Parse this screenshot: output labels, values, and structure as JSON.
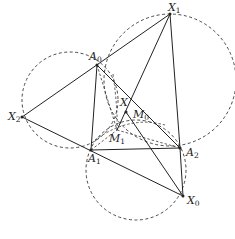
{
  "diagram": {
    "points": {
      "X1": {
        "label": "X",
        "sub": "1",
        "x": 170,
        "y": 14
      },
      "A0": {
        "label": "A",
        "sub": "0",
        "x": 97,
        "y": 65
      },
      "X2": {
        "label": "X",
        "sub": "2",
        "x": 22,
        "y": 117
      },
      "A1": {
        "label": "A",
        "sub": "1",
        "x": 91,
        "y": 150
      },
      "A2": {
        "label": "A",
        "sub": "2",
        "x": 180,
        "y": 148
      },
      "X0": {
        "label": "X",
        "sub": "0",
        "x": 183,
        "y": 196
      },
      "X": {
        "label": "X",
        "sub": "",
        "x": 131,
        "y": 102
      },
      "M0": {
        "label": "M",
        "sub": "0",
        "x": 126,
        "y": 112
      },
      "M1": {
        "label": "M",
        "sub": "1",
        "x": 117,
        "y": 130
      }
    },
    "stroke_color": "#222222",
    "dash_color": "#333333"
  }
}
